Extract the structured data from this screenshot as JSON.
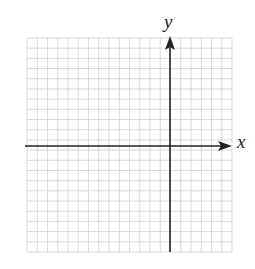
{
  "chart_data": {
    "type": "grid",
    "title": "",
    "xlabel": "x",
    "ylabel": "y",
    "grid": true,
    "grid_columns": 20,
    "grid_rows": 21,
    "yaxis_column_from_left": 14,
    "xaxis_row_from_top": 10.5,
    "data": []
  },
  "axes": {
    "x_label": "x",
    "y_label": "y"
  },
  "style": {
    "grid_color": "#cfcfcf",
    "axis_color": "#222222",
    "background": "#ffffff"
  }
}
